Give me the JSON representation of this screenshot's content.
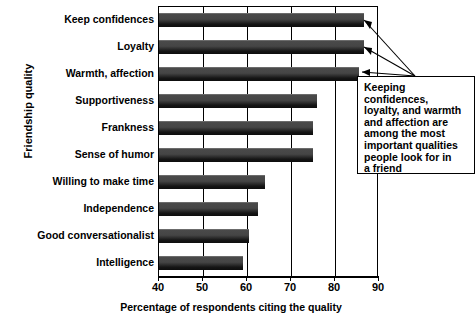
{
  "chart_data": {
    "type": "bar",
    "orientation": "horizontal",
    "title": "",
    "xlabel": "Percentage of respondents citing the quality",
    "ylabel": "Friendship quality",
    "xlim": [
      40,
      90
    ],
    "xticks": [
      40,
      50,
      60,
      70,
      80,
      90
    ],
    "grid": true,
    "legend": null,
    "categories": [
      "Keep confidences",
      "Loyalty",
      "Warmth, affection",
      "Supportiveness",
      "Frankness",
      "Sense of humor",
      "Willing to make time",
      "Independence",
      "Good conversationalist",
      "Intelligence"
    ],
    "values": [
      86.5,
      86.5,
      85.5,
      76,
      75,
      75,
      64,
      62.5,
      60.5,
      59
    ],
    "annotations": [
      {
        "text": "Keeping confidences, loyalty, and warmth and affection are among the most important qualities people look for in a friend",
        "points_to": [
          "Keep confidences",
          "Loyalty",
          "Warmth, affection"
        ]
      }
    ],
    "colors": {
      "bar": "#2a2a2a",
      "bar_highlight": "#4a4a4a",
      "axis": "#000000",
      "grid": "#000000",
      "background": "#ffffff"
    }
  },
  "callout": {
    "lines": [
      "Keeping",
      "confidences,",
      "loyalty, and warmth",
      "and affection are",
      "among the most",
      "important qualities",
      "people look for in",
      "a friend"
    ]
  }
}
